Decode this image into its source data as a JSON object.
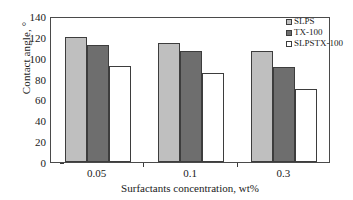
{
  "chart_data": {
    "type": "bar",
    "title": "",
    "xlabel": "Surfactants concentration, wt%",
    "ylabel": "Contact angle, °",
    "categories": [
      "0.05",
      "0.1",
      "0.3"
    ],
    "ylim": [
      0,
      140
    ],
    "yticks": [
      0,
      20,
      40,
      60,
      80,
      100,
      120,
      140
    ],
    "grid": false,
    "legend_position": "top-right",
    "series": [
      {
        "name": "SLPS",
        "color": "#bfbfbf",
        "values": [
          120,
          114,
          106
        ]
      },
      {
        "name": "TX-100",
        "color": "#6e6e6e",
        "values": [
          112,
          106,
          91
        ]
      },
      {
        "name": "SLPSTX-100",
        "color": "#ffffff",
        "values": [
          92,
          85,
          70
        ]
      }
    ]
  },
  "axis": {
    "border_color": "#4a4a4a",
    "tick_color": "#3a3a3a",
    "bar_edge_color": "#3d3d3d"
  }
}
